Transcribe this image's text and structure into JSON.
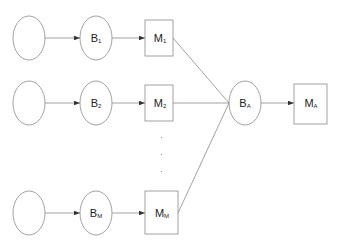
{
  "nodes": {
    "b1": {
      "main": "B",
      "sub": "1"
    },
    "b2": {
      "main": "B",
      "sub": "2"
    },
    "bm": {
      "main": "B",
      "sub": "M"
    },
    "m1": {
      "main": "M",
      "sub": "1"
    },
    "m2": {
      "main": "M",
      "sub": "2"
    },
    "mm": {
      "main": "M",
      "sub": "M"
    },
    "ba": {
      "main": "B",
      "sub": "A"
    },
    "ma": {
      "main": "M",
      "sub": "A"
    }
  },
  "colors": {
    "stroke": "#8a8a8a",
    "arrow": "#333333"
  }
}
